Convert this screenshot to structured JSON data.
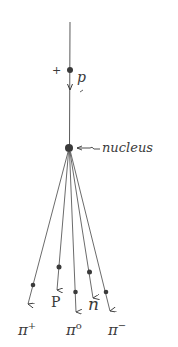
{
  "diagram": {
    "type": "particle-collision",
    "incoming": {
      "charge": "+",
      "label": "p"
    },
    "target": {
      "label": "nucleus"
    },
    "products": [
      {
        "id": "pi-plus",
        "label": "π",
        "sup": "+"
      },
      {
        "id": "proton",
        "label": "P",
        "sup": ""
      },
      {
        "id": "pi-zero",
        "label": "π",
        "sup": "o"
      },
      {
        "id": "neutron",
        "label": "n",
        "sup": ""
      },
      {
        "id": "pi-minus",
        "label": "π",
        "sup": "−"
      }
    ],
    "colors": {
      "ink": "#3a3a3a",
      "background": "#ffffff"
    }
  }
}
